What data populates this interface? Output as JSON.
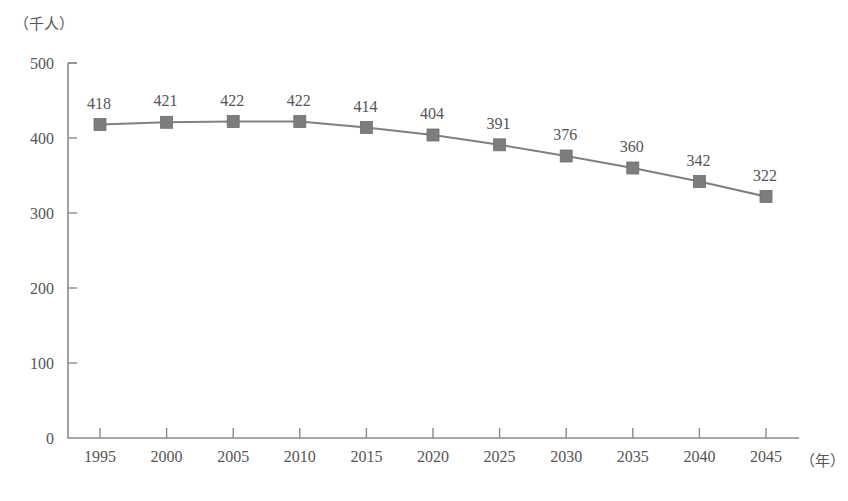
{
  "chart_data": {
    "type": "line",
    "title": "",
    "xlabel": "（年）",
    "ylabel": "（千人）",
    "categories": [
      "1995",
      "2000",
      "2005",
      "2010",
      "2015",
      "2020",
      "2025",
      "2030",
      "2035",
      "2040",
      "2045"
    ],
    "values": [
      418,
      421,
      422,
      422,
      414,
      404,
      391,
      376,
      360,
      342,
      322
    ],
    "series": [
      {
        "name": "",
        "values": [
          418,
          421,
          422,
          422,
          414,
          404,
          391,
          376,
          360,
          342,
          322
        ]
      }
    ],
    "data_labels": [
      "418",
      "421",
      "422",
      "422",
      "414",
      "404",
      "391",
      "376",
      "360",
      "342",
      "322"
    ],
    "ylim": [
      0,
      500
    ],
    "yticks": [
      0,
      100,
      200,
      300,
      400,
      500
    ],
    "ytick_labels": [
      "0",
      "100",
      "200",
      "300",
      "400",
      "500"
    ],
    "xtick_labels": [
      "1995",
      "2000",
      "2005",
      "2010",
      "2015",
      "2020",
      "2025",
      "2030",
      "2035",
      "2040",
      "2045"
    ],
    "grid": false,
    "legend": "none",
    "marker": "square",
    "colors": {
      "line": "#808080",
      "marker": "#7d7d7d",
      "axis": "#8a8a8a",
      "text": "#555555",
      "background": "#ffffff"
    }
  }
}
